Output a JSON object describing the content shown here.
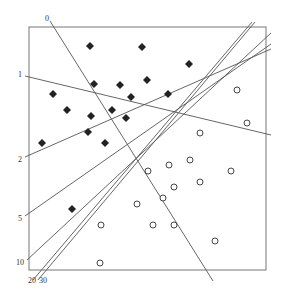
{
  "diagram": {
    "type": "perceptron-iterations",
    "frame": {
      "x": 29,
      "y": 27,
      "w": 237,
      "h": 243
    },
    "colors": {
      "frame": "#777777",
      "line": "#555555",
      "diamond": "#222222",
      "circle": "#444444"
    },
    "class_diamond_points": [
      [
        90,
        46
      ],
      [
        142,
        47
      ],
      [
        189,
        64
      ],
      [
        94,
        84
      ],
      [
        120,
        85
      ],
      [
        147,
        80
      ],
      [
        53,
        94
      ],
      [
        131,
        97
      ],
      [
        168,
        94
      ],
      [
        67,
        110
      ],
      [
        112,
        110
      ],
      [
        91,
        116
      ],
      [
        126,
        118
      ],
      [
        88,
        132
      ],
      [
        105,
        143
      ],
      [
        42,
        143
      ],
      [
        72,
        209
      ]
    ],
    "class_circle_points": [
      [
        237,
        90
      ],
      [
        247,
        123
      ],
      [
        200,
        133
      ],
      [
        190,
        160
      ],
      [
        169,
        165
      ],
      [
        148,
        171
      ],
      [
        231,
        171
      ],
      [
        200,
        182
      ],
      [
        174,
        187
      ],
      [
        163,
        198
      ],
      [
        137,
        204
      ],
      [
        101,
        225
      ],
      [
        153,
        225
      ],
      [
        174,
        225
      ],
      [
        215,
        241
      ],
      [
        100,
        263
      ]
    ],
    "lines": [
      {
        "label": "0",
        "x1": 50,
        "y1": 21,
        "x2": 213,
        "y2": 281,
        "lx": 45,
        "ly": 21
      },
      {
        "label": "1",
        "x1": 25,
        "y1": 76,
        "x2": 271,
        "y2": 135,
        "lx": 18,
        "ly": 77
      },
      {
        "label": "2",
        "x1": 25,
        "y1": 157,
        "x2": 271,
        "y2": 49,
        "lx": 18,
        "ly": 162
      },
      {
        "label": "5",
        "x1": 25,
        "y1": 216,
        "x2": 271,
        "y2": 44,
        "lx": 18,
        "ly": 221
      },
      {
        "label": "10",
        "x1": 27,
        "y1": 260,
        "x2": 271,
        "y2": 33,
        "lx": 16,
        "ly": 265
      },
      {
        "label": "20",
        "x1": 33,
        "y1": 280,
        "x2": 252,
        "y2": 22,
        "lx": 28,
        "ly": 283
      },
      {
        "label": "30",
        "x1": 38,
        "y1": 280,
        "x2": 255,
        "y2": 22,
        "lx": 39,
        "ly": 283
      }
    ]
  }
}
